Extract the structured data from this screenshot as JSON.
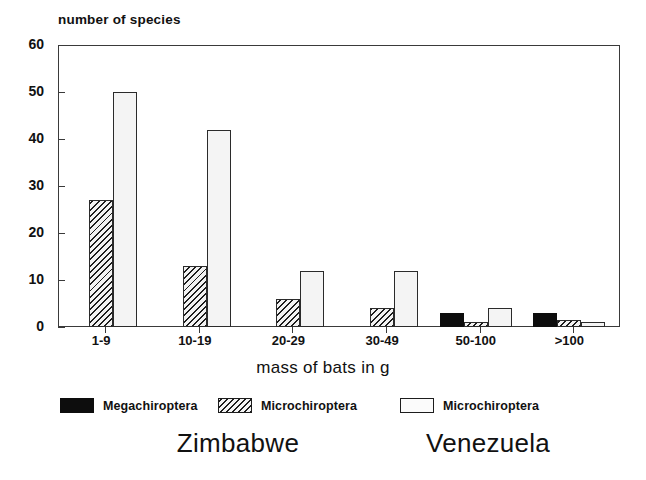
{
  "chart_data": {
    "type": "bar",
    "title": "",
    "ylabel": "number of species",
    "xlabel": "mass of bats in g",
    "categories": [
      "1-9",
      "10-19",
      "20-29",
      "30-49",
      "50-100",
      ">100"
    ],
    "series": [
      {
        "name": "Megachiroptera",
        "region": "Zimbabwe",
        "fill": "solid-black",
        "color": "#0d0d0d",
        "values": [
          0,
          0,
          0,
          0,
          3,
          3
        ]
      },
      {
        "name": "Microchiroptera",
        "region": "Zimbabwe",
        "fill": "diagonal-hatch",
        "color": "#1d1d1d",
        "values": [
          27,
          13,
          6,
          4,
          1,
          1.5
        ]
      },
      {
        "name": "Microchiroptera",
        "region": "Venezuela",
        "fill": "open-white",
        "color": "#f4f4f4",
        "values": [
          50,
          42,
          12,
          12,
          4,
          1
        ]
      }
    ],
    "yticks": [
      0,
      10,
      20,
      30,
      40,
      50,
      60
    ],
    "ylim": [
      0,
      60
    ],
    "grid": false,
    "legend_position": "below-axes"
  },
  "axes": {
    "y_title": "number of species",
    "x_title": "mass of bats in g",
    "y_tick_labels": [
      "60",
      "50",
      "40",
      "30",
      "20",
      "10",
      "0"
    ],
    "x_tick_labels": [
      "1-9",
      "10-19",
      "20-29",
      "30-49",
      "50-100",
      ">100"
    ]
  },
  "legend": {
    "items": [
      {
        "label": "Megachiroptera",
        "swatch": "solid-black-swatch"
      },
      {
        "label": "Microchiroptera",
        "swatch": "hatched-swatch"
      },
      {
        "label": "Microchiroptera",
        "swatch": "open-white-swatch"
      }
    ]
  },
  "captions": {
    "left": "Zimbabwe",
    "right": "Venezuela"
  },
  "colors": {
    "mega": "#0d0d0d",
    "micro_hatch": "#1d1d1d",
    "micro_open": "#f4f4f4",
    "axis": "#3a3a3a",
    "text": "#111111",
    "background": "#ffffff"
  }
}
